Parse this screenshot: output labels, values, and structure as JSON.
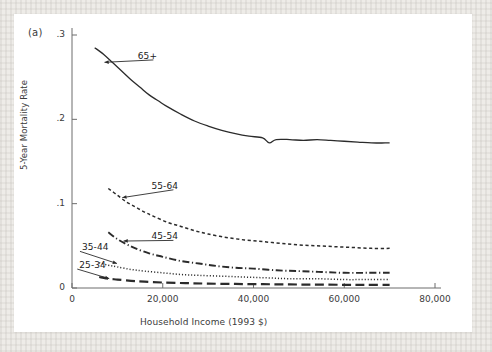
{
  "figure": {
    "panel_label": "(a)",
    "background_color": "#eeece8",
    "card_color": "#ffffff",
    "ink_color": "#2b2b2b"
  },
  "chart_data": {
    "type": "line",
    "title": "",
    "subtitle": "",
    "xlabel": "Household Income (1993 $)",
    "ylabel": "5-Year Mortality Rate",
    "xlim": [
      0,
      80000
    ],
    "ylim": [
      0,
      0.3
    ],
    "xticks": [
      0,
      20000,
      40000,
      60000,
      80000
    ],
    "xticklabels": [
      "0",
      "20,000",
      "40,000",
      "60,000",
      "80,000"
    ],
    "yticks": [
      0,
      0.1,
      0.2,
      0.3
    ],
    "yticklabels": [
      "0",
      ".1",
      ".2",
      ".3"
    ],
    "grid": false,
    "legend": "inline-annotations",
    "annotations": [
      {
        "label": "65+",
        "text_x": 14500,
        "text_y": 0.274,
        "point_x": 7600,
        "point_y": 0.268
      },
      {
        "label": "55-64",
        "text_x": 17500,
        "text_y": 0.12,
        "point_x": 11500,
        "point_y": 0.108
      },
      {
        "label": "45-54",
        "text_x": 17500,
        "text_y": 0.06,
        "point_x": 11800,
        "point_y": 0.056
      },
      {
        "label": "35-44",
        "text_x": 2200,
        "text_y": 0.047,
        "point_x": 9500,
        "point_y": 0.03
      },
      {
        "label": "25-34",
        "text_x": 1600,
        "text_y": 0.026,
        "point_x": 7800,
        "point_y": 0.012
      }
    ],
    "series": [
      {
        "name": "65+",
        "style": "solid",
        "x": [
          5000,
          7000,
          9000,
          11000,
          13000,
          15000,
          17000,
          19000,
          21000,
          24000,
          27000,
          30000,
          33000,
          36000,
          39000,
          42000,
          43500,
          45000,
          48000,
          51000,
          54000,
          57000,
          60000,
          63000,
          66000,
          69000,
          70000
        ],
        "y": [
          0.285,
          0.277,
          0.267,
          0.257,
          0.247,
          0.238,
          0.229,
          0.222,
          0.215,
          0.206,
          0.198,
          0.192,
          0.187,
          0.183,
          0.18,
          0.178,
          0.172,
          0.176,
          0.176,
          0.175,
          0.176,
          0.175,
          0.174,
          0.173,
          0.172,
          0.172,
          0.172
        ]
      },
      {
        "name": "55-64",
        "style": "dotted-dash",
        "x": [
          8000,
          10000,
          12000,
          14000,
          16000,
          18000,
          21000,
          24000,
          27000,
          30000,
          34000,
          38000,
          42000,
          46000,
          50000,
          54000,
          58000,
          62000,
          66000,
          70000
        ],
        "y": [
          0.118,
          0.11,
          0.102,
          0.096,
          0.09,
          0.085,
          0.078,
          0.073,
          0.068,
          0.064,
          0.06,
          0.057,
          0.055,
          0.053,
          0.051,
          0.05,
          0.049,
          0.048,
          0.047,
          0.047
        ]
      },
      {
        "name": "45-54",
        "style": "dash-dot",
        "x": [
          8000,
          10000,
          12000,
          14000,
          17000,
          20000,
          24000,
          28000,
          32000,
          36000,
          40000,
          45000,
          50000,
          55000,
          60000,
          65000,
          70000
        ],
        "y": [
          0.066,
          0.058,
          0.052,
          0.047,
          0.041,
          0.037,
          0.032,
          0.029,
          0.026,
          0.024,
          0.023,
          0.021,
          0.02,
          0.019,
          0.018,
          0.018,
          0.018
        ]
      },
      {
        "name": "35-44",
        "style": "dotted",
        "x": [
          6000,
          8000,
          10000,
          13000,
          16000,
          20000,
          24000,
          28000,
          33000,
          38000,
          43000,
          48000,
          54000,
          60000,
          65000,
          70000
        ],
        "y": [
          0.03,
          0.027,
          0.025,
          0.022,
          0.02,
          0.018,
          0.016,
          0.015,
          0.014,
          0.013,
          0.012,
          0.011,
          0.011,
          0.01,
          0.01,
          0.01
        ]
      },
      {
        "name": "25-34",
        "style": "long-dash",
        "x": [
          6000,
          8000,
          10000,
          13000,
          16000,
          20000,
          25000,
          30000,
          36000,
          42000,
          48000,
          54000,
          60000,
          65000,
          70000
        ],
        "y": [
          0.013,
          0.011,
          0.01,
          0.0085,
          0.0075,
          0.0065,
          0.0058,
          0.0052,
          0.0048,
          0.0045,
          0.0042,
          0.004,
          0.0038,
          0.0037,
          0.0036
        ]
      }
    ]
  }
}
